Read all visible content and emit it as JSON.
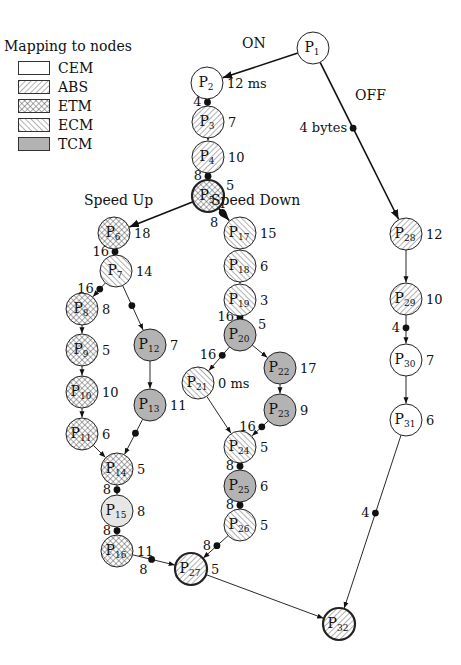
{
  "legend": {
    "title": "Mapping to nodes",
    "items": [
      {
        "key": "CEM",
        "label": "CEM",
        "fill": "plain"
      },
      {
        "key": "ABS",
        "label": "ABS",
        "fill": "hatch-forward"
      },
      {
        "key": "ETM",
        "label": "ETM",
        "fill": "crosshatch"
      },
      {
        "key": "ECM",
        "label": "ECM",
        "fill": "hatch-back"
      },
      {
        "key": "TCM",
        "label": "TCM",
        "fill": "gray"
      }
    ]
  },
  "colors": {
    "stroke": "#222222",
    "tcm_fill": "#b3b3b3",
    "light_fill": "#e6e6e6",
    "background": "#ffffff"
  },
  "labels": [
    {
      "text": "ON",
      "x": 242,
      "y": 48
    },
    {
      "text": "OFF",
      "x": 355,
      "y": 100
    },
    {
      "text": "Speed Up",
      "x": 84,
      "y": 205
    },
    {
      "text": "Speed Down",
      "x": 211,
      "y": 205
    }
  ],
  "nodes": [
    {
      "id": "P1",
      "num": "1",
      "x": 313,
      "y": 48,
      "type": "CEM",
      "thick": false,
      "annot": ""
    },
    {
      "id": "P2",
      "num": "2",
      "x": 207,
      "y": 83,
      "type": "CEM",
      "thick": false,
      "annot": "12 ms"
    },
    {
      "id": "P3",
      "num": "3",
      "x": 208,
      "y": 122,
      "type": "ABS",
      "thick": false,
      "annot": "7"
    },
    {
      "id": "P4",
      "num": "4",
      "x": 208,
      "y": 157,
      "type": "ABS",
      "thick": false,
      "annot": "10"
    },
    {
      "id": "P5",
      "num": "5",
      "x": 208,
      "y": 196,
      "type": "ETM",
      "thick": true,
      "annot": "5",
      "annot_pos": "tr"
    },
    {
      "id": "P6",
      "num": "6",
      "x": 114,
      "y": 233,
      "type": "ETM",
      "thick": false,
      "annot": "18"
    },
    {
      "id": "P7",
      "num": "7",
      "x": 116,
      "y": 271,
      "type": "ECM",
      "thick": false,
      "annot": "14"
    },
    {
      "id": "P8",
      "num": "8",
      "x": 82,
      "y": 309,
      "type": "ETM",
      "thick": false,
      "annot": "8"
    },
    {
      "id": "P9",
      "num": "9",
      "x": 82,
      "y": 350,
      "type": "ETM",
      "thick": false,
      "annot": "5"
    },
    {
      "id": "P10",
      "num": "10",
      "x": 82,
      "y": 392,
      "type": "ETM",
      "thick": false,
      "annot": "10"
    },
    {
      "id": "P11",
      "num": "11",
      "x": 82,
      "y": 434,
      "type": "ETM",
      "thick": false,
      "annot": "6"
    },
    {
      "id": "P12",
      "num": "12",
      "x": 150,
      "y": 345,
      "type": "TCM",
      "thick": false,
      "annot": "7"
    },
    {
      "id": "P13",
      "num": "13",
      "x": 150,
      "y": 405,
      "type": "TCM",
      "thick": false,
      "annot": "11"
    },
    {
      "id": "P14",
      "num": "14",
      "x": 117,
      "y": 469,
      "type": "ETM",
      "thick": false,
      "annot": "5"
    },
    {
      "id": "P15",
      "num": "15",
      "x": 117,
      "y": 511,
      "type": "LIGHT",
      "thick": false,
      "annot": "8"
    },
    {
      "id": "P16",
      "num": "16",
      "x": 117,
      "y": 551,
      "type": "ETM",
      "thick": false,
      "annot": "11"
    },
    {
      "id": "P17",
      "num": "17",
      "x": 240,
      "y": 233,
      "type": "ECM",
      "thick": false,
      "annot": "15"
    },
    {
      "id": "P18",
      "num": "18",
      "x": 240,
      "y": 266,
      "type": "ECM",
      "thick": false,
      "annot": "6"
    },
    {
      "id": "P19",
      "num": "19",
      "x": 240,
      "y": 300,
      "type": "ECM",
      "thick": false,
      "annot": "3"
    },
    {
      "id": "P20",
      "num": "20",
      "x": 240,
      "y": 335,
      "type": "TCM",
      "thick": false,
      "annot": "5",
      "annot_pos": "tr"
    },
    {
      "id": "P21",
      "num": "21",
      "x": 198,
      "y": 383,
      "type": "ECM",
      "thick": false,
      "annot": "0 ms"
    },
    {
      "id": "P22",
      "num": "22",
      "x": 280,
      "y": 368,
      "type": "TCM",
      "thick": false,
      "annot": "17"
    },
    {
      "id": "P23",
      "num": "23",
      "x": 280,
      "y": 410,
      "type": "TCM",
      "thick": false,
      "annot": "9"
    },
    {
      "id": "P24",
      "num": "24",
      "x": 240,
      "y": 447,
      "type": "ECM",
      "thick": false,
      "annot": "5"
    },
    {
      "id": "P25",
      "num": "25",
      "x": 240,
      "y": 486,
      "type": "TCM",
      "thick": false,
      "annot": "6"
    },
    {
      "id": "P26",
      "num": "26",
      "x": 240,
      "y": 525,
      "type": "ECM",
      "thick": false,
      "annot": "5"
    },
    {
      "id": "P27",
      "num": "27",
      "x": 191,
      "y": 569,
      "type": "ABS",
      "thick": true,
      "annot": "5"
    },
    {
      "id": "P28",
      "num": "28",
      "x": 406,
      "y": 234,
      "type": "ABS",
      "thick": false,
      "annot": "12"
    },
    {
      "id": "P29",
      "num": "29",
      "x": 406,
      "y": 299,
      "type": "ABS",
      "thick": false,
      "annot": "10"
    },
    {
      "id": "P30",
      "num": "30",
      "x": 406,
      "y": 360,
      "type": "CEM",
      "thick": false,
      "annot": "7"
    },
    {
      "id": "P31",
      "num": "31",
      "x": 406,
      "y": 420,
      "type": "CEM",
      "thick": false,
      "annot": "6"
    },
    {
      "id": "P32",
      "num": "32",
      "x": 339,
      "y": 624,
      "type": "ABS",
      "thick": true,
      "annot": ""
    }
  ],
  "edges": [
    {
      "from": "P1",
      "to": "P2",
      "thick": true
    },
    {
      "from": "P1",
      "to": "P28",
      "thick": true,
      "dot": 0.42,
      "dot_label": "4 bytes",
      "dot_label_side": "left"
    },
    {
      "from": "P2",
      "to": "P3",
      "thick": false,
      "dot": 0.5,
      "dot_label": "4",
      "dot_label_side": "left"
    },
    {
      "from": "P3",
      "to": "P4",
      "thick": false
    },
    {
      "from": "P4",
      "to": "P5",
      "thick": false,
      "dot": 0.5,
      "dot_label": "8",
      "dot_label_side": "left"
    },
    {
      "from": "P5",
      "to": "P6",
      "thick": true
    },
    {
      "from": "P5",
      "to": "P17",
      "thick": true,
      "dot": 0.35,
      "dot_label": "8",
      "dot_label_side": "below"
    },
    {
      "from": "P6",
      "to": "P7",
      "thick": false,
      "dot": 0.5,
      "dot_label": "16",
      "dot_label_side": "left"
    },
    {
      "from": "P7",
      "to": "P8",
      "thick": false,
      "dot": 0.45,
      "dot_label": "16",
      "dot_label_side": "left"
    },
    {
      "from": "P7",
      "to": "P12",
      "thick": false,
      "dot": 0.45
    },
    {
      "from": "P8",
      "to": "P9",
      "thick": false
    },
    {
      "from": "P9",
      "to": "P10",
      "thick": false
    },
    {
      "from": "P10",
      "to": "P11",
      "thick": false
    },
    {
      "from": "P11",
      "to": "P14",
      "thick": false
    },
    {
      "from": "P12",
      "to": "P13",
      "thick": false
    },
    {
      "from": "P13",
      "to": "P14",
      "thick": false,
      "dot": 0.4
    },
    {
      "from": "P14",
      "to": "P15",
      "thick": false,
      "dot": 0.5,
      "dot_label": "8",
      "dot_label_side": "left"
    },
    {
      "from": "P15",
      "to": "P16",
      "thick": false,
      "dot": 0.5,
      "dot_label": "8",
      "dot_label_side": "left"
    },
    {
      "from": "P16",
      "to": "P27",
      "thick": false,
      "dot": 0.45,
      "dot_label": "8",
      "dot_label_side": "below"
    },
    {
      "from": "P17",
      "to": "P18",
      "thick": false
    },
    {
      "from": "P18",
      "to": "P19",
      "thick": false
    },
    {
      "from": "P19",
      "to": "P20",
      "thick": false,
      "dot": 0.5,
      "dot_label": "16",
      "dot_label_side": "left"
    },
    {
      "from": "P20",
      "to": "P21",
      "thick": false,
      "dot": 0.35,
      "dot_label": "16",
      "dot_label_side": "left"
    },
    {
      "from": "P20",
      "to": "P22",
      "thick": false
    },
    {
      "from": "P21",
      "to": "P24",
      "thick": false
    },
    {
      "from": "P22",
      "to": "P23",
      "thick": false
    },
    {
      "from": "P23",
      "to": "P24",
      "thick": false,
      "dot": 0.4,
      "dot_label": "16",
      "dot_label_side": "left"
    },
    {
      "from": "P24",
      "to": "P25",
      "thick": false,
      "dot": 0.5,
      "dot_label": "8",
      "dot_label_side": "left"
    },
    {
      "from": "P25",
      "to": "P26",
      "thick": false,
      "dot": 0.5,
      "dot_label": "8",
      "dot_label_side": "left"
    },
    {
      "from": "P26",
      "to": "P27",
      "thick": false,
      "dot": 0.45,
      "dot_label": "8",
      "dot_label_side": "left"
    },
    {
      "from": "P27",
      "to": "P32",
      "thick": false
    },
    {
      "from": "P28",
      "to": "P29",
      "thick": false
    },
    {
      "from": "P29",
      "to": "P30",
      "thick": false,
      "dot": 0.45,
      "dot_label": "4",
      "dot_label_side": "left"
    },
    {
      "from": "P30",
      "to": "P31",
      "thick": false
    },
    {
      "from": "P31",
      "to": "P32",
      "thick": false,
      "dot": 0.45,
      "dot_label": "4",
      "dot_label_side": "left"
    }
  ]
}
